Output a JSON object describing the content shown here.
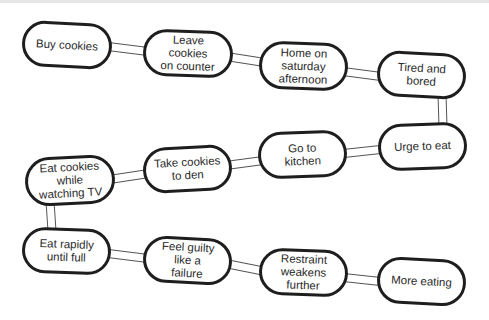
{
  "diagram": {
    "type": "chain-of-links",
    "colors": {
      "outline": "#1e1e1e",
      "text": "#2a2a2a",
      "link_fill": "#ffffff",
      "link_stroke": "#555555"
    },
    "nodes": [
      {
        "id": "n1",
        "label": "Buy cookies",
        "x": 22,
        "y": 22,
        "w": 90,
        "h": 46,
        "rot": 3
      },
      {
        "id": "n2",
        "label": "Leave cookies\non counter",
        "x": 143,
        "y": 30,
        "w": 90,
        "h": 47,
        "rot": 2
      },
      {
        "id": "n3",
        "label": "Home on\nsaturday\nafternoon",
        "x": 259,
        "y": 42,
        "w": 89,
        "h": 48,
        "rot": 2
      },
      {
        "id": "n4",
        "label": "Tired and\nbored",
        "x": 377,
        "y": 52,
        "w": 89,
        "h": 46,
        "rot": 3
      },
      {
        "id": "n5",
        "label": "Urge to eat",
        "x": 378,
        "y": 123,
        "w": 89,
        "h": 47,
        "rot": -2
      },
      {
        "id": "n6",
        "label": "Go to\nkitchen",
        "x": 258,
        "y": 131,
        "w": 89,
        "h": 47,
        "rot": -2
      },
      {
        "id": "n7",
        "label": "Take cookies\nto den",
        "x": 143,
        "y": 146,
        "w": 89,
        "h": 46,
        "rot": -3
      },
      {
        "id": "n8",
        "label": "Eat cookies\nwhile\nwatching TV",
        "x": 25,
        "y": 156,
        "w": 90,
        "h": 49,
        "rot": -3
      },
      {
        "id": "n9",
        "label": "Eat rapidly\nuntil full",
        "x": 22,
        "y": 228,
        "w": 89,
        "h": 46,
        "rot": 2
      },
      {
        "id": "n10",
        "label": "Feel guilty\nlike a\nfailure",
        "x": 143,
        "y": 237,
        "w": 89,
        "h": 47,
        "rot": 3
      },
      {
        "id": "n11",
        "label": "Restraint\nweakens\nfurther",
        "x": 259,
        "y": 249,
        "w": 89,
        "h": 47,
        "rot": 2
      },
      {
        "id": "n12",
        "label": "More eating",
        "x": 377,
        "y": 258,
        "w": 89,
        "h": 47,
        "rot": 3
      }
    ],
    "links": [
      {
        "from": "n1",
        "to": "n2",
        "x1": 104,
        "y1": 46,
        "x2": 152,
        "y2": 52
      },
      {
        "from": "n2",
        "to": "n3",
        "x1": 223,
        "y1": 56,
        "x2": 268,
        "y2": 63
      },
      {
        "from": "n3",
        "to": "n4",
        "x1": 339,
        "y1": 71,
        "x2": 385,
        "y2": 77
      },
      {
        "from": "n4",
        "to": "n5",
        "x1": 442,
        "y1": 94,
        "x2": 443,
        "y2": 127
      },
      {
        "from": "n5",
        "to": "n6",
        "x1": 385,
        "y1": 149,
        "x2": 339,
        "y2": 154
      },
      {
        "from": "n6",
        "to": "n7",
        "x1": 267,
        "y1": 160,
        "x2": 222,
        "y2": 166
      },
      {
        "from": "n7",
        "to": "n8",
        "x1": 152,
        "y1": 173,
        "x2": 106,
        "y2": 180
      },
      {
        "from": "n8",
        "to": "n9",
        "x1": 50,
        "y1": 201,
        "x2": 52,
        "y2": 231
      },
      {
        "from": "n9",
        "to": "n10",
        "x1": 104,
        "y1": 253,
        "x2": 152,
        "y2": 259
      },
      {
        "from": "n10",
        "to": "n11",
        "x1": 223,
        "y1": 263,
        "x2": 268,
        "y2": 272
      },
      {
        "from": "n11",
        "to": "n12",
        "x1": 339,
        "y1": 277,
        "x2": 385,
        "y2": 282
      }
    ]
  }
}
